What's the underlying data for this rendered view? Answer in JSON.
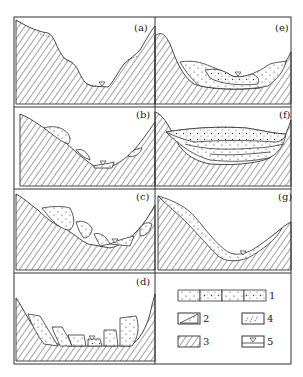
{
  "figure": {
    "panels": [
      {
        "id": "a",
        "label": "(a)"
      },
      {
        "id": "b",
        "label": "(b)"
      },
      {
        "id": "c",
        "label": "(c)"
      },
      {
        "id": "d",
        "label": "(d)"
      },
      {
        "id": "e",
        "label": "(e)"
      },
      {
        "id": "f",
        "label": "(f)"
      },
      {
        "id": "g",
        "label": "(g)"
      }
    ],
    "legend": {
      "items": [
        {
          "number": "1",
          "symbol": "dotted-sediment-pattern"
        },
        {
          "number": "2",
          "symbol": "landslide-wedge-pattern"
        },
        {
          "number": "3",
          "symbol": "bedrock-hatch-pattern"
        },
        {
          "number": "4",
          "symbol": "loose-debris-pattern"
        },
        {
          "number": "5",
          "symbol": "water-table-symbol"
        }
      ]
    }
  }
}
